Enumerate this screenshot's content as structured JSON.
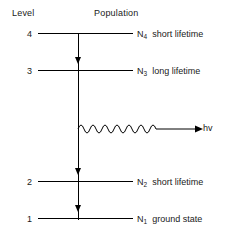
{
  "headers": {
    "level": "Level",
    "population": "Population"
  },
  "levels": [
    {
      "number": "4",
      "symbol": "N",
      "subscript": "4",
      "description": "short  lifetime",
      "y": 27,
      "has_arrowhead": false
    },
    {
      "number": "3",
      "symbol": "N",
      "subscript": "3",
      "description": "long  lifetime",
      "y": 64,
      "has_arrowhead": true
    },
    {
      "number": "2",
      "symbol": "N",
      "subscript": "2",
      "description": "short  lifetime",
      "y": 175,
      "has_arrowhead": true
    },
    {
      "number": "1",
      "symbol": "N",
      "subscript": "1",
      "description": "ground  state",
      "y": 212,
      "has_arrowhead": true
    }
  ],
  "photon": {
    "label": "hv",
    "icon": "wavy-arrow-right-icon"
  },
  "colors": {
    "line": "#000000",
    "text": "#1a1a1a",
    "background": "#ffffff"
  }
}
